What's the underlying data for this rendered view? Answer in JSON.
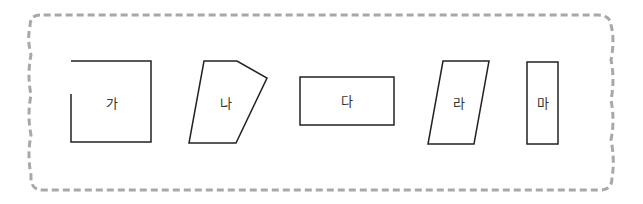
{
  "figure": {
    "border_color": "#a8a8a8",
    "stroke_color": "#222222",
    "shapes": [
      {
        "id": "ga",
        "label": "가",
        "kind": "open-square"
      },
      {
        "id": "na",
        "label": "나",
        "kind": "pentagon"
      },
      {
        "id": "da",
        "label": "다",
        "kind": "rectangle"
      },
      {
        "id": "ra",
        "label": "라",
        "kind": "parallelogram"
      },
      {
        "id": "ma",
        "label": "마",
        "kind": "narrow-rectangle"
      }
    ]
  }
}
